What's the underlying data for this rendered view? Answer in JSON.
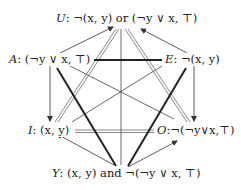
{
  "diagram": {
    "nodes": {
      "U": {
        "letter": "U",
        "formula": ": ¬(x, y) or (¬y ∨ x, ⊤)"
      },
      "A": {
        "letter": "A",
        "formula": ": (¬y ∨ x, ⊤)"
      },
      "E": {
        "letter": "E",
        "formula": ": ¬(x, y)"
      },
      "I": {
        "letter": "I",
        "formula": ": (x, y)"
      },
      "O": {
        "letter": "O",
        "formula": ":¬(¬y∨x,⊤)"
      },
      "Y": {
        "letter": "Y",
        "formula": ": (x, y) and ¬(¬y ∨ x, ⊤)"
      }
    },
    "edges": [
      {
        "from": "A",
        "to": "E",
        "style": "thick",
        "relation": "contrary"
      },
      {
        "from": "I",
        "to": "O",
        "style": "double",
        "relation": "subcontrary"
      },
      {
        "from": "U",
        "to": "Y",
        "style": "thin",
        "relation": "contradictory"
      },
      {
        "from": "A",
        "to": "O",
        "style": "thin",
        "relation": "contradictory"
      },
      {
        "from": "E",
        "to": "I",
        "style": "thin",
        "relation": "contradictory"
      },
      {
        "from": "A",
        "to": "I",
        "style": "arrow",
        "relation": "subalternation"
      },
      {
        "from": "E",
        "to": "O",
        "style": "arrow",
        "relation": "subalternation"
      },
      {
        "from": "A",
        "to": "U",
        "style": "arrow",
        "relation": "implication"
      },
      {
        "from": "E",
        "to": "U",
        "style": "arrow",
        "relation": "implication"
      },
      {
        "from": "Y",
        "to": "I",
        "style": "arrow",
        "relation": "implication"
      },
      {
        "from": "Y",
        "to": "O",
        "style": "arrow",
        "relation": "implication"
      },
      {
        "from": "U",
        "to": "I",
        "style": "double",
        "relation": "subcontrary"
      },
      {
        "from": "U",
        "to": "O",
        "style": "double",
        "relation": "subcontrary"
      },
      {
        "from": "A",
        "to": "Y",
        "style": "thick",
        "relation": "contrary"
      },
      {
        "from": "E",
        "to": "Y",
        "style": "thick",
        "relation": "contrary"
      }
    ]
  }
}
